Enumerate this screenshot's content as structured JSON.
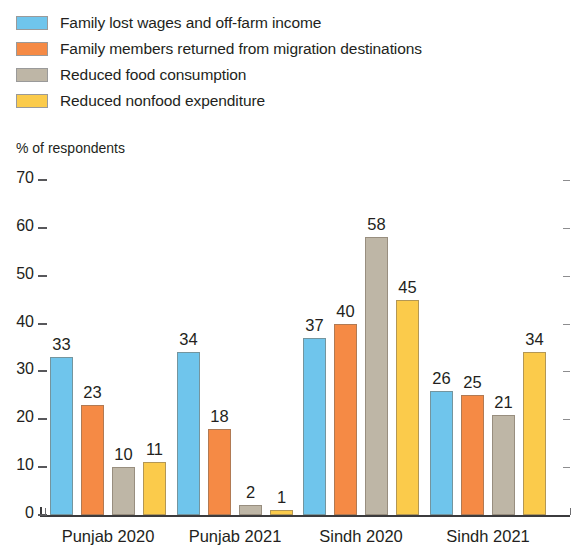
{
  "chart_data": {
    "type": "bar",
    "title": "",
    "subtitle": "",
    "xlabel": "",
    "ylabel": "% of respondents",
    "ylim": [
      0,
      70
    ],
    "ytick_values": [
      70,
      60,
      50,
      40,
      30,
      20,
      10,
      0
    ],
    "ytick_labels": [
      "70",
      "60",
      "50",
      "40",
      "30",
      "20",
      "10",
      "0"
    ],
    "grid": false,
    "legend_position": "top-left",
    "categories": [
      "Punjab 2020",
      "Punjab 2021",
      "Sindh 2020",
      "Sindh 2021"
    ],
    "series": [
      {
        "name": "Family lost wages and off-farm income",
        "color": "#6FC5EC",
        "values": [
          33,
          34,
          37,
          26
        ],
        "labels": [
          "33",
          "34",
          "37",
          "26"
        ]
      },
      {
        "name": "Family members returned from migration destinations",
        "color": "#F58A45",
        "values": [
          23,
          18,
          40,
          25
        ],
        "labels": [
          "23",
          "18",
          "40",
          "25"
        ]
      },
      {
        "name": "Reduced food consumption",
        "color": "#BEB6A6",
        "values": [
          10,
          2,
          58,
          21
        ],
        "labels": [
          "10",
          "2",
          "58",
          "21"
        ]
      },
      {
        "name": "Reduced nonfood expenditure",
        "color": "#FBCB4B",
        "values": [
          11,
          1,
          45,
          34
        ],
        "labels": [
          "11",
          "1",
          "45",
          "34"
        ]
      }
    ]
  },
  "legend": {
    "items": [
      {
        "label": "Family lost wages and off-farm income",
        "color": "#6FC5EC",
        "swatch_name": "legend-swatch-blue"
      },
      {
        "label": "Family members returned from migration destinations",
        "color": "#F58A45",
        "swatch_name": "legend-swatch-orange"
      },
      {
        "label": "Reduced food consumption",
        "color": "#BEB6A6",
        "swatch_name": "legend-swatch-gray"
      },
      {
        "label": "Reduced nonfood expenditure",
        "color": "#FBCB4B",
        "swatch_name": "legend-swatch-yellow"
      }
    ]
  }
}
